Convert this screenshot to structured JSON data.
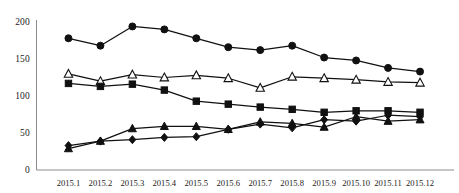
{
  "chart_data": {
    "type": "line",
    "title": "",
    "subtitle": "",
    "xlabel": "",
    "ylabel": "",
    "grid": false,
    "legend": "none",
    "xlim": [
      0,
      13
    ],
    "ylim": [
      0,
      200
    ],
    "yticks": [
      0,
      50,
      100,
      150,
      200
    ],
    "ytick_labels": [
      "0",
      "50",
      "100",
      "150",
      "200"
    ],
    "categories": [
      "2015.1",
      "2015.2",
      "2015.3",
      "2015.4",
      "2015.5",
      "2015.6",
      "2015.7",
      "2015.8",
      "2015.9",
      "2015.10",
      "2015.11",
      "2015.12"
    ],
    "series": [
      {
        "name": "Series 1",
        "marker": "filled-circle",
        "values": [
          178,
          168,
          194,
          190,
          178,
          166,
          162,
          168,
          152,
          148,
          138,
          133
        ]
      },
      {
        "name": "Series 2",
        "marker": "open-triangle",
        "values": [
          130,
          120,
          129,
          125,
          128,
          124,
          111,
          126,
          124,
          122,
          119,
          118
        ]
      },
      {
        "name": "Series 3",
        "marker": "filled-square",
        "values": [
          117,
          113,
          116,
          108,
          93,
          89,
          85,
          82,
          78,
          80,
          80,
          78
        ]
      },
      {
        "name": "Series 4",
        "marker": "filled-diamond",
        "values": [
          33,
          39,
          41,
          44,
          45,
          55,
          62,
          57,
          68,
          66,
          74,
          72
        ]
      },
      {
        "name": "Series 5",
        "marker": "filled-triangle",
        "values": [
          29,
          39,
          56,
          59,
          59,
          55,
          65,
          63,
          58,
          72,
          66,
          68
        ]
      }
    ]
  },
  "axes": {
    "axis_color": "#8c8c8c",
    "line_color": "#111111",
    "marker_fill": "#111111",
    "marker_open_fill": "#ffffff"
  }
}
